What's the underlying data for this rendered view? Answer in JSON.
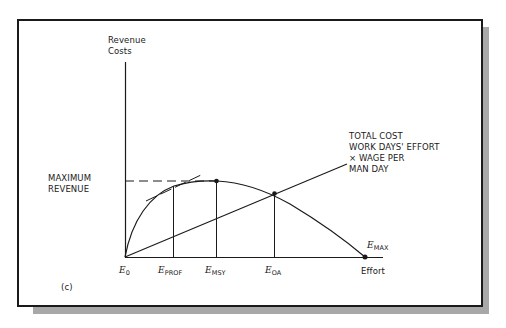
{
  "figure": {
    "panel_label": "(c)",
    "y_axis_label_line1": "Revenue",
    "y_axis_label_line2": "Costs",
    "x_axis_label": "Effort",
    "max_revenue_line1": "MAXIMUM",
    "max_revenue_line2": "REVENUE",
    "cost_label_line1": "TOTAL COST",
    "cost_label_line2": "WORK DAYS' EFFORT",
    "cost_label_line3": "× WAGE PER",
    "cost_label_line4": "MAN DAY",
    "points": {
      "e0": {
        "main": "E",
        "sub": "0"
      },
      "eprof": {
        "main": "E",
        "sub": "PROF"
      },
      "emsy": {
        "main": "E",
        "sub": "MSY"
      },
      "eoa": {
        "main": "E",
        "sub": "OA"
      },
      "emax": {
        "main": "E",
        "sub": "MAX"
      }
    },
    "colors": {
      "ink": "#1a1a1a",
      "shadow": "#a8a8a8",
      "background": "#ffffff"
    }
  }
}
